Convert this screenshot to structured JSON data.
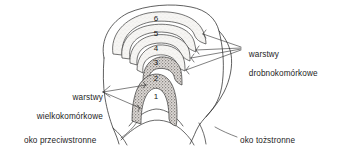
{
  "figure": {
    "language": "pl",
    "background_color": "#ffffff",
    "line_color": "#2b2b2b",
    "magnocellular_fill": "#b9b4b0",
    "parvocellular_fill": "#efeeec"
  },
  "labels": {
    "parvocellular": {
      "line1": "warstwy",
      "line2": "drobnokomórkowe"
    },
    "magnocellular": {
      "line1": "warstwy",
      "line2": "wielkokomórkowe"
    },
    "contralateral_eye": "oko przeciwstronne",
    "ipsilateral_eye": "oko tożstronne"
  },
  "layers": [
    {
      "number": "1",
      "type": "magnocellular",
      "eye": "contralateral"
    },
    {
      "number": "2",
      "type": "magnocellular",
      "eye": "ipsilateral"
    },
    {
      "number": "3",
      "type": "parvocellular",
      "eye": "ipsilateral"
    },
    {
      "number": "4",
      "type": "parvocellular",
      "eye": "contralateral"
    },
    {
      "number": "5",
      "type": "parvocellular",
      "eye": "ipsilateral"
    },
    {
      "number": "6",
      "type": "parvocellular",
      "eye": "contralateral"
    }
  ]
}
